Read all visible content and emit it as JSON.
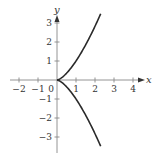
{
  "chart_data": {
    "type": "line",
    "title": "",
    "xlabel": "x",
    "ylabel": "y",
    "xlim": [
      -2.4,
      4.6
    ],
    "ylim": [
      -3.8,
      3.3
    ],
    "x_ticks": [
      -2,
      -1,
      0,
      1,
      2,
      3,
      4
    ],
    "x_tick_labels": [
      "−2",
      "−1",
      "0",
      "1",
      "2",
      "3",
      "4"
    ],
    "y_ticks": [
      3,
      2,
      1,
      -1,
      -2,
      -3
    ],
    "y_tick_labels": [
      "3",
      "2",
      "1",
      "−1",
      "−2",
      "−3"
    ],
    "grid": false,
    "legend": null,
    "series": [
      {
        "name": "y^2 = x^3 (upper branch)",
        "color": "#2a2a2a",
        "x": [
          0,
          0.25,
          0.5,
          0.75,
          1.0,
          1.25,
          1.5,
          1.75,
          2.0,
          2.3
        ],
        "y": [
          0,
          0.125,
          0.354,
          0.65,
          1.0,
          1.398,
          1.837,
          2.315,
          2.828,
          3.488
        ]
      },
      {
        "name": "y^2 = x^3 (lower branch)",
        "color": "#2a2a2a",
        "x": [
          0,
          0.25,
          0.5,
          0.75,
          1.0,
          1.25,
          1.5,
          1.75,
          2.0,
          2.3
        ],
        "y": [
          0,
          -0.125,
          -0.354,
          -0.65,
          -1.0,
          -1.398,
          -1.837,
          -2.315,
          -2.828,
          -3.488
        ]
      }
    ],
    "annotations": []
  },
  "layout": {
    "origin_px": [
      57,
      80
    ],
    "unit_px": 19
  }
}
